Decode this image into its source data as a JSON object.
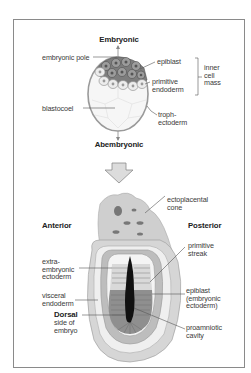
{
  "top_panel": {
    "title_top": "Embryonic",
    "title_bottom": "Abembryonic",
    "labels": {
      "embryonic_pole": "embryonic pole",
      "epiblast": "epiblast",
      "primitive_endoderm": "primitive\nendoderm",
      "inner_cell_mass": "inner\ncell\nmass",
      "blastocoel": "blastocoel",
      "trophectoderm": "troph-\nectoderm"
    }
  },
  "arrow": {
    "icon": "down-arrow-icon",
    "color": "#d9d9d9"
  },
  "bottom_panel": {
    "anterior": "Anterior",
    "posterior": "Posterior",
    "labels": {
      "ectoplacental_cone": "ectoplacental\ncone",
      "primitive_streak": "primitive\nstreak",
      "extra_embryonic_ectoderm": "extra-\nembryonic\nectoderm",
      "visceral_endoderm": "visceral\nendoderm",
      "epiblast": "epiblast\n(embryonic\nectoderm)",
      "dorsal_title": "Dorsal",
      "dorsal_rest": "side of\nembryo",
      "proamniotic_cavity": "proamniotic\ncavity"
    }
  },
  "colors": {
    "frame": "#8a8a8a",
    "epiblast_fill": "#7a7a7a",
    "endoderm_fill": "#e6e6e6",
    "blastocoel_fill": "#f7f7f7",
    "outer_tissue": "#c4c4c4",
    "cavity": "#111111",
    "leader": "#555555"
  }
}
